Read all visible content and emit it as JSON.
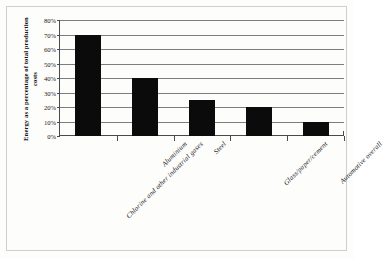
{
  "chart_data": {
    "type": "bar",
    "title": "",
    "subtitle": "",
    "xlabel": "",
    "ylabel": "Energy as a percentage of total production costs",
    "categories": [
      "Chlorine and other industrial gases",
      "Aluminium",
      "Steel",
      "Glass/paper/cement",
      "Automotive overall"
    ],
    "values": [
      70,
      40,
      25,
      20,
      10
    ],
    "value_labels": [
      "70%",
      "40%",
      "25%",
      "20%",
      "10%"
    ],
    "ylim": [
      0,
      80
    ],
    "ytick_values": [
      0,
      10,
      20,
      30,
      40,
      50,
      60,
      70,
      80
    ],
    "ytick_labels": [
      "0%",
      "10%",
      "20%",
      "30%",
      "40%",
      "50%",
      "60%",
      "70%",
      "80%"
    ],
    "grid": true,
    "grid_axis": "y",
    "legend": false,
    "legend_position": "none",
    "bar_color": "#0b0b0b",
    "gridline_color": "#7d7d7d",
    "axis_color": "#4a4a4a",
    "background_color": "#fdfdfc",
    "units": "percent",
    "unit_suffix": "%"
  }
}
